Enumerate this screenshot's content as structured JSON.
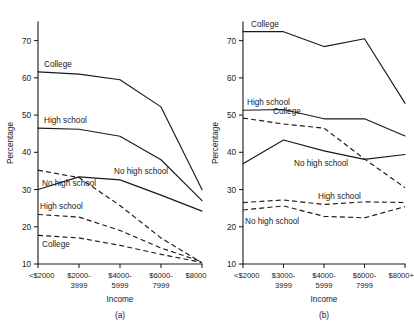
{
  "figure": {
    "panels": [
      {
        "id": "a",
        "panel_label": "(a)",
        "ylabel": "Percentage",
        "xlabel": "Income"
      },
      {
        "id": "b",
        "panel_label": "(b)",
        "ylabel": "Percentage",
        "xlabel": "Income"
      }
    ]
  },
  "chart_data": [
    {
      "type": "line",
      "title": "",
      "panel": "(a)",
      "xlabel": "Income",
      "ylabel": "Percentage",
      "categories": [
        "<$2000",
        "$2000-\n3999",
        "$4000-\n5999",
        "$6000-\n7999",
        "$8000+"
      ],
      "category_lines": [
        [
          "<$2000"
        ],
        [
          "$2000-",
          "3999"
        ],
        [
          "$4000-",
          "5999"
        ],
        [
          "$6000-",
          "7999"
        ],
        [
          "$8000+"
        ]
      ],
      "ylim": [
        10,
        75
      ],
      "yticks": [
        10,
        20,
        30,
        40,
        50,
        60,
        70
      ],
      "grid": false,
      "legend": "inline-labels",
      "series": [
        {
          "name": "College",
          "style": "solid",
          "label": "College",
          "label_at": "start",
          "values": [
            61.6,
            61.0,
            59.5,
            52.2,
            30.0
          ]
        },
        {
          "name": "High school",
          "style": "solid",
          "label": "High school",
          "label_at": "start",
          "values": [
            46.5,
            46.2,
            44.3,
            38.0,
            27.0
          ]
        },
        {
          "name": "No high school",
          "style": "solid",
          "label": "No high school",
          "label_at": "middle",
          "values": [
            30.0,
            33.4,
            32.6,
            28.5,
            24.2
          ]
        },
        {
          "name": "No high school (dashed)",
          "style": "dashed",
          "label": "No high school",
          "label_at": "start",
          "values": [
            35.2,
            33.2,
            25.7,
            17.0,
            10.3
          ]
        },
        {
          "name": "High school (dashed)",
          "style": "dashed",
          "label": "High school",
          "label_at": "start",
          "values": [
            23.3,
            22.6,
            19.0,
            14.3,
            10.6
          ]
        },
        {
          "name": "College (dashed)",
          "style": "dashed",
          "label": "College",
          "label_at": "middle",
          "values": [
            17.7,
            17.0,
            15.0,
            12.6,
            10.4
          ]
        }
      ]
    },
    {
      "type": "line",
      "title": "",
      "panel": "(b)",
      "xlabel": "Income",
      "ylabel": "Percentage",
      "categories": [
        "<$2000",
        "$3000-\n3999",
        "$4000-\n5999",
        "$6000-\n7999",
        "$8000+"
      ],
      "category_lines": [
        [
          "<$2000"
        ],
        [
          "$3000-",
          "3999"
        ],
        [
          "$4000-",
          "5999"
        ],
        [
          "$6000-",
          "7999"
        ],
        [
          "$8000+"
        ]
      ],
      "ylim": [
        10,
        75
      ],
      "yticks": [
        10,
        20,
        30,
        40,
        50,
        60,
        70
      ],
      "grid": false,
      "legend": "inline-labels",
      "series": [
        {
          "name": "College",
          "style": "solid",
          "label": "College",
          "label_at": "start",
          "values": [
            72.4,
            72.4,
            68.4,
            70.5,
            53.2
          ]
        },
        {
          "name": "High school",
          "style": "solid",
          "label": "High school",
          "label_at": "start",
          "values": [
            51.3,
            51.5,
            49.0,
            49.0,
            44.4
          ]
        },
        {
          "name": "No high school",
          "style": "solid",
          "label": "No high school",
          "label_at": "middle",
          "values": [
            36.9,
            43.3,
            40.4,
            38.1,
            39.4
          ]
        },
        {
          "name": "College (dashed)",
          "style": "dashed",
          "label": "College",
          "label_at": "start",
          "values": [
            49.2,
            47.6,
            46.5,
            38.2,
            30.5
          ]
        },
        {
          "name": "High school (dashed)",
          "style": "dashed",
          "label": "High school",
          "label_at": "middle",
          "values": [
            26.5,
            27.2,
            26.0,
            26.7,
            26.5
          ]
        },
        {
          "name": "No high school (dashed)",
          "style": "dashed",
          "label": "No high school",
          "label_at": "start",
          "values": [
            24.5,
            25.6,
            22.8,
            22.4,
            25.4
          ]
        }
      ]
    }
  ]
}
